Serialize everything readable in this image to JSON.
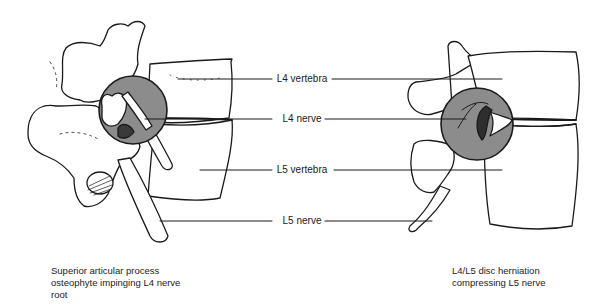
{
  "diagram": {
    "type": "anatomical-illustration",
    "highlight_color": "#8c8c8c",
    "line_color": "#1a1a1a",
    "labels": [
      {
        "id": "l4-vertebra",
        "text": "L4 vertebra",
        "y": 79
      },
      {
        "id": "l4-nerve",
        "text": "L4 nerve",
        "y": 119
      },
      {
        "id": "l5-vertebra",
        "text": "L5 vertebra",
        "y": 170
      },
      {
        "id": "l5-nerve",
        "text": "L5 nerve",
        "y": 221
      }
    ],
    "panels": [
      {
        "id": "left",
        "caption_lines": [
          "Superior articular process",
          "osteophyte impinging L4 nerve",
          "root"
        ]
      },
      {
        "id": "right",
        "caption_lines": [
          "L4/L5 disc herniation",
          "compressing L5 nerve"
        ]
      }
    ]
  }
}
